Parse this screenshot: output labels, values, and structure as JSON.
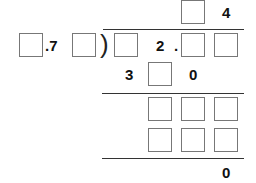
{
  "problem": {
    "type": "long-division-puzzle",
    "quotient": {
      "box_count": 1,
      "known_digit": "4"
    },
    "divisor": {
      "prefix_box": true,
      "known_text": ".7",
      "suffix_box": true
    },
    "dividend": {
      "leading_box": true,
      "known_digit": "2",
      "decimal_point": ".",
      "trailing_boxes": 2
    },
    "step1": {
      "left_digit": "3",
      "middle_box": true,
      "right_digit": "0"
    },
    "step2_rows": [
      {
        "boxes": 3
      },
      {
        "boxes": 3
      }
    ],
    "remainder": "0"
  }
}
